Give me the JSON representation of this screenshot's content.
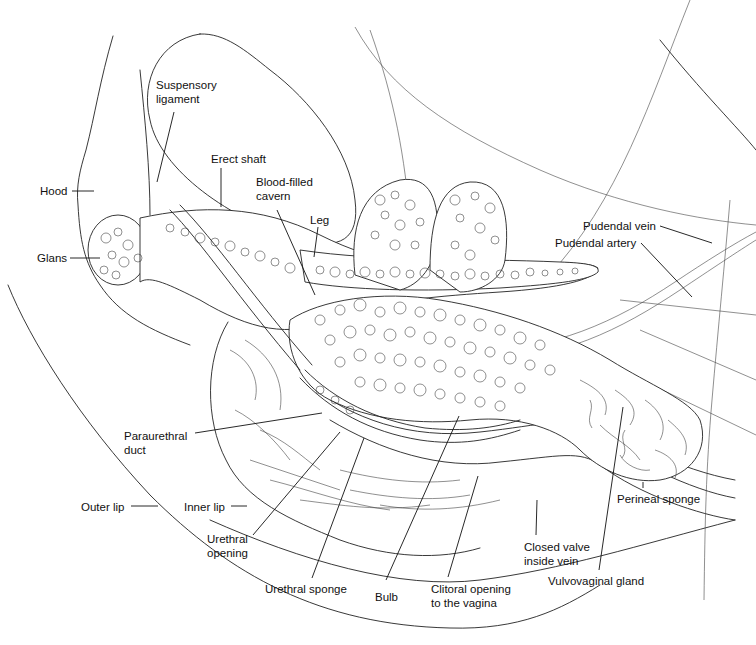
{
  "figure": {
    "type": "anatomical line illustration",
    "background": "#ffffff",
    "ink": "#111111"
  },
  "labels": [
    {
      "id": "suspensory-ligament",
      "text": "Suspensory\nligament",
      "x": 156,
      "y": 78,
      "leader": [
        [
          174,
          112
        ],
        [
          157,
          182
        ]
      ]
    },
    {
      "id": "erect-shaft",
      "text": "Erect shaft",
      "x": 211,
      "y": 152,
      "leader": [
        [
          221,
          168
        ],
        [
          221,
          207
        ]
      ]
    },
    {
      "id": "hood",
      "text": "Hood",
      "x": 40,
      "y": 184,
      "leader": [
        [
          72,
          191
        ],
        [
          94,
          191
        ]
      ]
    },
    {
      "id": "blood-filled-cavern",
      "text": "Blood-filled\ncavern",
      "x": 256,
      "y": 175,
      "leader": [
        [
          277,
          210
        ],
        [
          315,
          295
        ]
      ]
    },
    {
      "id": "leg",
      "text": "Leg",
      "x": 310,
      "y": 213,
      "leader": [
        [
          318,
          227
        ],
        [
          314,
          257
        ]
      ]
    },
    {
      "id": "glans",
      "text": "Glans",
      "x": 37,
      "y": 251,
      "leader": [
        [
          70,
          258
        ],
        [
          100,
          258
        ]
      ]
    },
    {
      "id": "pudendal-vein",
      "text": "Pudendal vein",
      "x": 583,
      "y": 219,
      "leader": [
        [
          660,
          226
        ],
        [
          712,
          243
        ]
      ]
    },
    {
      "id": "pudendal-artery",
      "text": "Pudendal artery",
      "x": 555,
      "y": 236,
      "leader": [
        [
          641,
          243
        ],
        [
          692,
          297
        ]
      ]
    },
    {
      "id": "paraurethral-duct",
      "text": "Paraurethral\nduct",
      "x": 124,
      "y": 429,
      "leader": [
        [
          195,
          433
        ],
        [
          322,
          413
        ]
      ]
    },
    {
      "id": "outer-lip",
      "text": "Outer lip",
      "x": 81,
      "y": 500,
      "leader": [
        [
          131,
          506
        ],
        [
          158,
          506
        ]
      ]
    },
    {
      "id": "inner-lip",
      "text": "Inner lip",
      "x": 184,
      "y": 500,
      "leader": [
        [
          231,
          506
        ],
        [
          247,
          506
        ]
      ]
    },
    {
      "id": "urethral-opening",
      "text": "Urethral\nopening",
      "x": 207,
      "y": 532,
      "leader": [
        [
          253,
          535
        ],
        [
          340,
          432
        ]
      ]
    },
    {
      "id": "urethral-sponge",
      "text": "Urethral sponge",
      "x": 265,
      "y": 582,
      "leader": [
        [
          312,
          578
        ],
        [
          364,
          438
        ]
      ]
    },
    {
      "id": "bulb",
      "text": "Bulb",
      "x": 375,
      "y": 590,
      "leader": [
        [
          386,
          580
        ],
        [
          459,
          416
        ]
      ]
    },
    {
      "id": "clitoral-opening",
      "text": "Clitoral opening\nto the vagina",
      "x": 431,
      "y": 582,
      "leader": [
        [
          448,
          577
        ],
        [
          478,
          476
        ]
      ]
    },
    {
      "id": "closed-valve",
      "text": "Closed valve\ninside vein",
      "x": 524,
      "y": 540,
      "leader": [
        [
          536,
          535
        ],
        [
          537,
          500
        ]
      ]
    },
    {
      "id": "perineal-sponge",
      "text": "Perineal sponge",
      "x": 617,
      "y": 492,
      "leader": [
        [
          643,
          488
        ],
        [
          643,
          482
        ]
      ]
    },
    {
      "id": "vulvovaginal-gland",
      "text": "Vulvovaginal gland",
      "x": 548,
      "y": 574,
      "leader": [
        [
          599,
          570
        ],
        [
          623,
          407
        ]
      ]
    }
  ]
}
